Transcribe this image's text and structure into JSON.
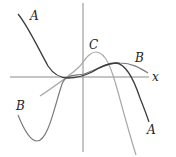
{
  "diagram": {
    "type": "function-graphs",
    "axes": {
      "x_label": "x",
      "x_axis_y": 77,
      "y_axis_x": 83
    },
    "curves": [
      {
        "id": "A",
        "label": "A",
        "color": "#3c3c3c"
      },
      {
        "id": "B",
        "label": "B",
        "color": "#7a7a7a"
      },
      {
        "id": "C",
        "label": "C",
        "color": "#a8a8a8"
      }
    ],
    "labels": {
      "a_top": "A",
      "a_bottom": "A",
      "b_left": "B",
      "b_right": "B",
      "c_top": "C",
      "x_axis": "x"
    }
  }
}
